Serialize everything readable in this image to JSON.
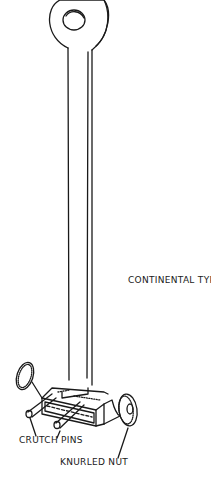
{
  "figure": {
    "labels": {
      "type": "CONTINENTAL TYPE",
      "pins": "CRUTCH PINS",
      "nut": "KNURLED NUT"
    },
    "colors": {
      "ink": "#1a1a1a",
      "background": "#ffffff"
    }
  }
}
